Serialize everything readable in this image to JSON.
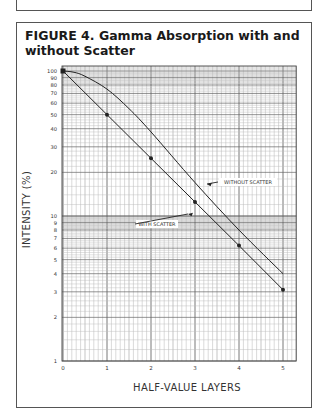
{
  "header_snippet": "MICROSIEVERTS PER HOUR AT ONE METER PER GIGABECQUEREL.",
  "figure": {
    "title": "FIGURE 4. Gamma Absorption with and without Scatter"
  },
  "chart_data": {
    "type": "line",
    "title": "FIGURE 4. Gamma Absorption with and without Scatter",
    "xlabel": "HALF-VALUE LAYERS",
    "ylabel": "INTENSITY (%)",
    "xscale": "linear",
    "yscale": "log",
    "xlim": [
      0,
      5.3
    ],
    "ylim": [
      1,
      100
    ],
    "x_ticks": [
      0,
      1,
      2,
      3,
      4,
      5
    ],
    "y_ticks": [
      1,
      2,
      3,
      4,
      5,
      6,
      7,
      8,
      9,
      10,
      20,
      30,
      40,
      50,
      60,
      70,
      80,
      90,
      100
    ],
    "grid": true,
    "series": [
      {
        "name": "WITHOUT SCATTER",
        "x": [
          0,
          0.25,
          0.5,
          1,
          1.5,
          2,
          3,
          4,
          5
        ],
        "values": [
          100,
          98,
          92,
          75,
          55,
          38,
          17,
          8,
          4
        ],
        "markers": false
      },
      {
        "name": "WITH SCATTER",
        "x": [
          0,
          1,
          2,
          3,
          4,
          5
        ],
        "values": [
          100,
          50,
          25,
          12.5,
          6.25,
          3.1
        ],
        "markers": true
      }
    ],
    "annotations": [
      {
        "text": "WITHOUT SCATTER",
        "points_to_series": "WITHOUT SCATTER"
      },
      {
        "text": "WITH SCATTER",
        "points_to_series": "WITH SCATTER"
      }
    ]
  }
}
